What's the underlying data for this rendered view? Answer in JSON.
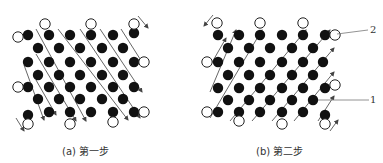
{
  "figure": {
    "panels": [
      {
        "id": "a",
        "caption": "(a) 第一步",
        "arrow_direction": "down-right",
        "filled_circles": [
          [
            28,
            35
          ],
          [
            49,
            35
          ],
          [
            70,
            35
          ],
          [
            91,
            35
          ],
          [
            113,
            35
          ],
          [
            134,
            33
          ],
          [
            38,
            48
          ],
          [
            59,
            48
          ],
          [
            80,
            48
          ],
          [
            102,
            48
          ],
          [
            123,
            48
          ],
          [
            28,
            62
          ],
          [
            49,
            62
          ],
          [
            70,
            62
          ],
          [
            91,
            62
          ],
          [
            113,
            62
          ],
          [
            134,
            62
          ],
          [
            38,
            75
          ],
          [
            59,
            75
          ],
          [
            80,
            75
          ],
          [
            102,
            75
          ],
          [
            123,
            75
          ],
          [
            28,
            87
          ],
          [
            49,
            87
          ],
          [
            70,
            87
          ],
          [
            91,
            87
          ],
          [
            113,
            87
          ],
          [
            134,
            87
          ],
          [
            38,
            99
          ],
          [
            59,
            99
          ],
          [
            80,
            99
          ],
          [
            102,
            99
          ],
          [
            123,
            99
          ],
          [
            28,
            115
          ],
          [
            49,
            112
          ],
          [
            70,
            112
          ],
          [
            91,
            112
          ],
          [
            113,
            112
          ],
          [
            134,
            112
          ]
        ],
        "open_circles": [
          [
            45,
            24
          ],
          [
            91,
            24
          ],
          [
            134,
            24
          ],
          [
            18,
            37
          ],
          [
            18,
            87
          ],
          [
            144,
            62
          ],
          [
            144,
            112
          ],
          [
            28,
            124
          ],
          [
            70,
            124
          ],
          [
            113,
            122
          ]
        ],
        "arrows": [
          {
            "from": [
              36,
              29
            ],
            "to": [
              86,
              121
            ]
          },
          {
            "from": [
              58,
              29
            ],
            "to": [
              128,
              120
            ]
          },
          {
            "from": [
              80,
              29
            ],
            "to": [
              140,
              118
            ]
          },
          {
            "from": [
              100,
              29
            ],
            "to": [
              142,
              92
            ]
          },
          {
            "from": [
              121,
              29
            ],
            "to": [
              142,
              62
            ]
          },
          {
            "from": [
              36,
              54
            ],
            "to": [
              76,
              121
            ]
          },
          {
            "from": [
              36,
              80
            ],
            "to": [
              56,
              115
            ]
          },
          {
            "from": [
              24,
              65
            ],
            "to": [
              44,
              120
            ]
          },
          {
            "from": [
              138,
              16
            ],
            "to": [
              148,
              28
            ]
          },
          {
            "from": [
              16,
              118
            ],
            "to": [
              24,
              131
            ]
          }
        ]
      },
      {
        "id": "b",
        "caption": "(b) 第二步",
        "arrow_direction": "up-right",
        "filled_circles": [
          [
            218,
            35
          ],
          [
            239,
            35
          ],
          [
            260,
            35
          ],
          [
            282,
            35
          ],
          [
            303,
            35
          ],
          [
            325,
            35
          ],
          [
            228,
            48
          ],
          [
            249,
            48
          ],
          [
            270,
            48
          ],
          [
            292,
            48
          ],
          [
            313,
            48
          ],
          [
            218,
            62
          ],
          [
            239,
            62
          ],
          [
            260,
            62
          ],
          [
            282,
            62
          ],
          [
            303,
            62
          ],
          [
            323,
            62
          ],
          [
            228,
            75
          ],
          [
            249,
            75
          ],
          [
            270,
            75
          ],
          [
            292,
            75
          ],
          [
            313,
            75
          ],
          [
            218,
            88
          ],
          [
            239,
            88
          ],
          [
            260,
            88
          ],
          [
            282,
            88
          ],
          [
            303,
            88
          ],
          [
            325,
            88
          ],
          [
            228,
            100
          ],
          [
            249,
            100
          ],
          [
            270,
            100
          ],
          [
            292,
            100
          ],
          [
            313,
            100
          ],
          [
            218,
            112
          ],
          [
            239,
            112
          ],
          [
            260,
            112
          ],
          [
            282,
            112
          ],
          [
            303,
            112
          ],
          [
            325,
            115
          ]
        ],
        "open_circles": [
          [
            217,
            23
          ],
          [
            260,
            23
          ],
          [
            303,
            23
          ],
          [
            335,
            35
          ],
          [
            335,
            85
          ],
          [
            207,
            62
          ],
          [
            207,
            112
          ],
          [
            239,
            121
          ],
          [
            282,
            124
          ],
          [
            325,
            124
          ]
        ],
        "arrows": [
          {
            "from": [
              210,
              118
            ],
            "to": [
              262,
              30
            ]
          },
          {
            "from": [
              230,
              121
            ],
            "to": [
              306,
              30
            ]
          },
          {
            "from": [
              252,
              121
            ],
            "to": [
              330,
              30
            ]
          },
          {
            "from": [
              272,
              121
            ],
            "to": [
              334,
              48
            ]
          },
          {
            "from": [
              294,
              121
            ],
            "to": [
              334,
              72
            ]
          },
          {
            "from": [
              210,
              92
            ],
            "to": [
              236,
              30
            ]
          },
          {
            "from": [
              210,
              66
            ],
            "to": [
              226,
              38
            ]
          },
          {
            "from": [
              318,
              121
            ],
            "to": [
              334,
              96
            ]
          },
          {
            "from": [
              213,
              15
            ],
            "to": [
              204,
              26
            ]
          },
          {
            "from": [
              330,
              131
            ],
            "to": [
              338,
              120
            ]
          }
        ],
        "callouts": [
          {
            "label": "2",
            "line_from": [
              337,
              34
            ],
            "line_to": [
              368,
              30
            ],
            "text_pos": [
              370,
              24
            ]
          },
          {
            "label": "1",
            "line_from": [
              318,
              100
            ],
            "line_to": [
              369,
              100
            ],
            "text_pos": [
              370,
              94
            ]
          }
        ]
      }
    ]
  },
  "colors": {
    "filled": "#111111",
    "open_stroke": "#222222",
    "arrow": "#555555",
    "background": "#ffffff"
  },
  "circle_radius": 5.2
}
